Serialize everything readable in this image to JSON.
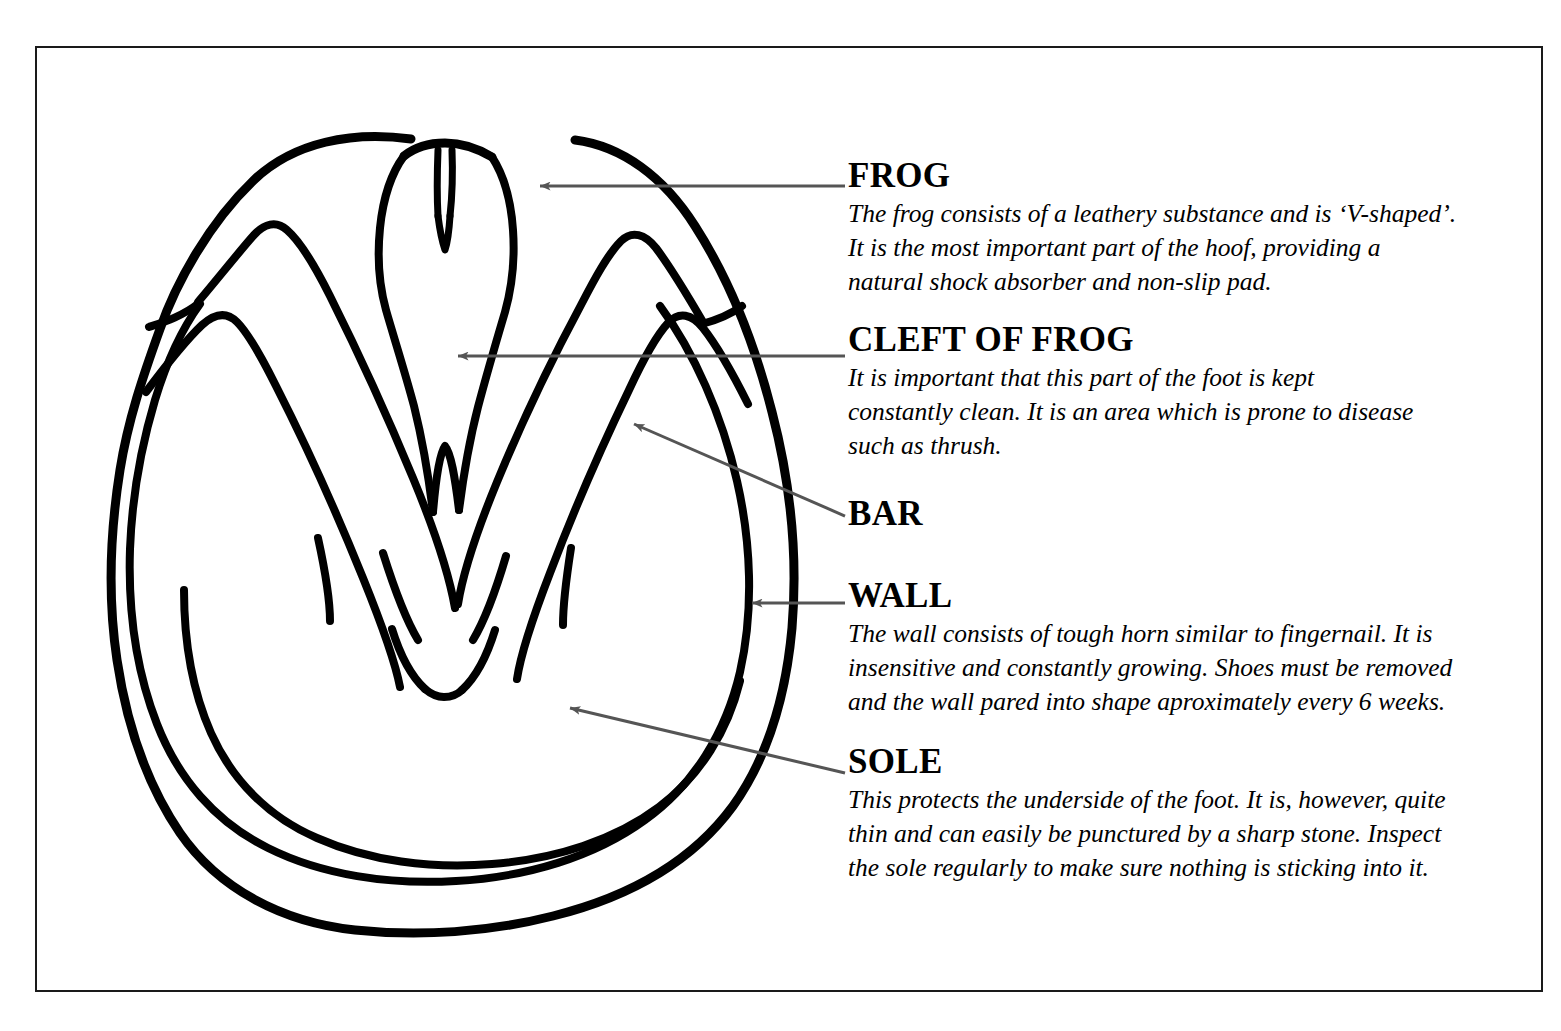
{
  "figure": {
    "line_color": "#000000",
    "arrow_color": "#555555",
    "border_color": "#1a1a1a",
    "background_color": "#ffffff"
  },
  "annotations": [
    {
      "id": "frog",
      "heading": "FROG",
      "lines": [
        "The frog consists of a leathery substance and is ‘V-shaped’.",
        "It is the most important part of the hoof, providing a",
        "natural shock absorber and non-slip pad."
      ]
    },
    {
      "id": "cleft",
      "heading": "CLEFT OF FROG",
      "lines": [
        "It is important that this part of the foot is kept",
        "constantly clean. It is an area which is prone to disease",
        "such as thrush."
      ]
    },
    {
      "id": "bar",
      "heading": "BAR",
      "lines": []
    },
    {
      "id": "wall",
      "heading": "WALL",
      "lines": [
        "The wall consists of tough horn similar to fingernail. It is",
        "insensitive and constantly growing. Shoes must be removed",
        "and the wall pared into shape aproximately every 6 weeks."
      ]
    },
    {
      "id": "sole",
      "heading": "SOLE",
      "lines": [
        "This protects the underside of the foot. It is, however, quite",
        "thin and can easily be punctured by a sharp stone. Inspect",
        "the sole regularly to make sure nothing is sticking into it."
      ]
    }
  ],
  "leader_lines": [
    {
      "label": "FROG",
      "from_x": 845,
      "from_y": 186,
      "to_x": 540,
      "to_y": 186
    },
    {
      "label": "CLEFT OF FROG",
      "from_x": 845,
      "from_y": 356,
      "to_x": 458,
      "to_y": 356
    },
    {
      "label": "BAR",
      "from_x": 845,
      "from_y": 516,
      "to_x": 632,
      "to_y": 423
    },
    {
      "label": "WALL",
      "from_x": 845,
      "from_y": 603,
      "to_x": 750,
      "to_y": 603
    },
    {
      "label": "SOLE",
      "from_x": 845,
      "from_y": 773,
      "to_x": 568,
      "to_y": 707
    }
  ]
}
